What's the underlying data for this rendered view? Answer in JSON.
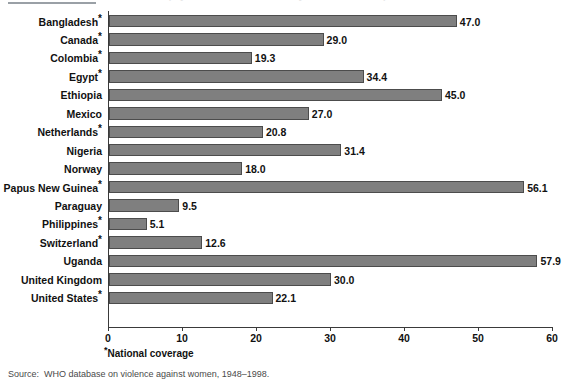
{
  "figure": {
    "title_fragment": "Prevalence of physical assault on women by an intimate male partner",
    "footnote_marker": "*",
    "footnote_text": "National coverage",
    "source_label": "Source:",
    "source_text": "WHO database on violence against women, 1948–1998."
  },
  "style": {
    "bar_fill": "#7f7f7f",
    "bar_border": "#4c4c4c",
    "axis_color": "#3a3a3a",
    "text_color": "#111111",
    "background": "#ffffff"
  },
  "chart_data": {
    "type": "bar",
    "orientation": "horizontal",
    "title": "Prevalence of physical assault on women by an intimate male partner",
    "xlabel": "",
    "ylabel": "",
    "xlim": [
      0,
      60
    ],
    "xticks": [
      0,
      10,
      20,
      30,
      40,
      50,
      60
    ],
    "xtick_labels": [
      "0",
      "10",
      "20",
      "30",
      "40",
      "50",
      "60"
    ],
    "grid": false,
    "legend": null,
    "value_label_format": "one decimal",
    "categories": [
      "Bangladesh*",
      "Canada*",
      "Colombia*",
      "Egypt*",
      "Ethiopia",
      "Mexico",
      "Netherlands*",
      "Nigeria",
      "Norway",
      "Papus New Guinea*",
      "Paraguay",
      "Philippines*",
      "Switzerland*",
      "Uganda",
      "United Kingdom",
      "United States*"
    ],
    "values": [
      47.0,
      29.0,
      19.3,
      34.4,
      45.0,
      27.0,
      20.8,
      31.4,
      18.0,
      56.1,
      9.5,
      5.1,
      12.6,
      57.9,
      30.0,
      22.1
    ],
    "value_labels": [
      "47.0",
      "29.0",
      "19.3",
      "34.4",
      "45.0",
      "27.0",
      "20.8",
      "31.4",
      "18.0",
      "56.1",
      "9.5",
      "5.1",
      "12.6",
      "57.9",
      "30.0",
      "22.1"
    ],
    "rows": [
      {
        "name": "Bangladesh",
        "starred": true,
        "value": 47.0,
        "label": "47.0"
      },
      {
        "name": "Canada",
        "starred": true,
        "value": 29.0,
        "label": "29.0"
      },
      {
        "name": "Colombia",
        "starred": true,
        "value": 19.3,
        "label": "19.3"
      },
      {
        "name": "Egypt",
        "starred": true,
        "value": 34.4,
        "label": "34.4"
      },
      {
        "name": "Ethiopia",
        "starred": false,
        "value": 45.0,
        "label": "45.0"
      },
      {
        "name": "Mexico",
        "starred": false,
        "value": 27.0,
        "label": "27.0"
      },
      {
        "name": "Netherlands",
        "starred": true,
        "value": 20.8,
        "label": "20.8"
      },
      {
        "name": "Nigeria",
        "starred": false,
        "value": 31.4,
        "label": "31.4"
      },
      {
        "name": "Norway",
        "starred": false,
        "value": 18.0,
        "label": "18.0"
      },
      {
        "name": "Papus New Guinea",
        "starred": true,
        "value": 56.1,
        "label": "56.1"
      },
      {
        "name": "Paraguay",
        "starred": false,
        "value": 9.5,
        "label": "9.5"
      },
      {
        "name": "Philippines",
        "starred": true,
        "value": 5.1,
        "label": "5.1"
      },
      {
        "name": "Switzerland",
        "starred": true,
        "value": 12.6,
        "label": "12.6"
      },
      {
        "name": "Uganda",
        "starred": false,
        "value": 57.9,
        "label": "57.9"
      },
      {
        "name": "United Kingdom",
        "starred": false,
        "value": 30.0,
        "label": "30.0"
      },
      {
        "name": "United States",
        "starred": true,
        "value": 22.1,
        "label": "22.1"
      }
    ]
  }
}
